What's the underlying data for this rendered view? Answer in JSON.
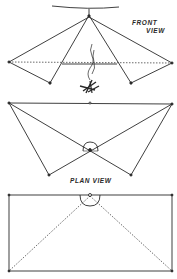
{
  "diagram": {
    "front_view": {
      "label_line1": "FRONT",
      "label_line2": "VIEW"
    },
    "plan_view": {
      "label": "PLAN VIEW"
    },
    "colors": {
      "ink": "#2a2a2a",
      "background": "#ffffff"
    }
  }
}
